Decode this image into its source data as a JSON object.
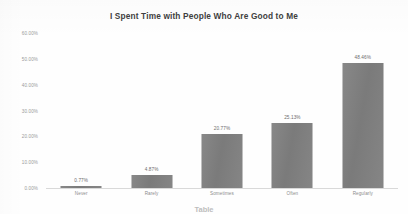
{
  "chart_data": {
    "type": "bar",
    "title": "I Spent Time with People Who Are Good to Me",
    "xlabel": "",
    "ylabel": "",
    "categories": [
      "Never",
      "Rarely",
      "Sometimes",
      "Often",
      "Regularly"
    ],
    "values": [
      0.77,
      4.87,
      20.77,
      25.13,
      48.46
    ],
    "value_labels": [
      "0.77%",
      "4.87%",
      "20.77%",
      "25.13%",
      "48.46%"
    ],
    "ylim": [
      0,
      60
    ],
    "ytick_values": [
      0,
      10,
      20,
      30,
      40,
      50,
      60
    ],
    "ytick_labels": [
      "0.00%",
      "10.00%",
      "20.00%",
      "30.00%",
      "40.00%",
      "50.00%",
      "60.00%"
    ],
    "grid": false,
    "legend": false,
    "series_color": "#7f7f7f",
    "title_color": "#3f3f3f",
    "tick_color": "#9a9a9a"
  },
  "caption": {
    "text": "Table"
  }
}
